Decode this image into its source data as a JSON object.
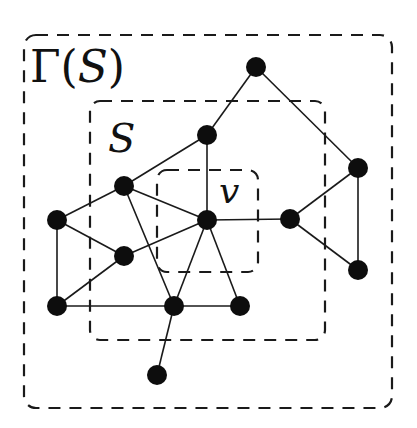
{
  "labels": {
    "gamma_prefix": "Γ(",
    "gamma_arg": "S",
    "gamma_suffix": ")",
    "set": "S",
    "vertex": "v"
  },
  "regions": [
    {
      "id": "gamma-s",
      "label": "Γ(S)",
      "style": "dashed"
    },
    {
      "id": "s",
      "label": "S",
      "style": "dashed"
    },
    {
      "id": "v",
      "label": "v",
      "style": "dashed"
    }
  ],
  "colors": {
    "node": "#0d0d0d",
    "edge": "#1a1a1a",
    "background": "#ffffff"
  },
  "graph": {
    "nodes": [
      "A",
      "B",
      "C",
      "D",
      "E",
      "F",
      "G",
      "H",
      "I",
      "J",
      "K",
      "L",
      "M"
    ],
    "special_node": "D",
    "edges": [
      [
        "A",
        "B"
      ],
      [
        "A",
        "L"
      ],
      [
        "B",
        "C"
      ],
      [
        "B",
        "D"
      ],
      [
        "C",
        "E"
      ],
      [
        "C",
        "D"
      ],
      [
        "C",
        "H"
      ],
      [
        "E",
        "F"
      ],
      [
        "E",
        "G"
      ],
      [
        "F",
        "D"
      ],
      [
        "F",
        "G"
      ],
      [
        "G",
        "H"
      ],
      [
        "D",
        "H"
      ],
      [
        "D",
        "I"
      ],
      [
        "D",
        "K"
      ],
      [
        "H",
        "I"
      ],
      [
        "H",
        "J"
      ],
      [
        "K",
        "L"
      ],
      [
        "K",
        "M"
      ],
      [
        "L",
        "M"
      ]
    ]
  }
}
